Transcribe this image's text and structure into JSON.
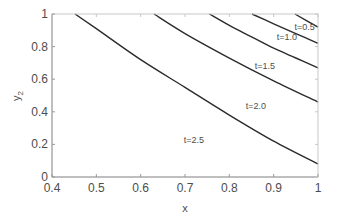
{
  "chart_data": {
    "type": "line",
    "title": "",
    "xlabel": "x",
    "ylabel": "y",
    "ylabel_subscript": "2",
    "xlim": [
      0.4,
      1.0
    ],
    "ylim": [
      0,
      1
    ],
    "grid": false,
    "legend": "inline curve labels",
    "x_ticks": [
      "0.4",
      "0.5",
      "0.6",
      "0.7",
      "0.8",
      "0.9",
      "1"
    ],
    "y_ticks": [
      "0",
      "0.2",
      "0.4",
      "0.6",
      "0.8",
      "1"
    ],
    "series": [
      {
        "name": "t=0.5",
        "x": [
          0.948,
          1.0
        ],
        "y": [
          1.0,
          0.92
        ],
        "label_pos": [
          0.97,
          0.9
        ]
      },
      {
        "name": "t=1.0",
        "x": [
          0.851,
          0.9,
          0.95,
          1.0
        ],
        "y": [
          1.0,
          0.94,
          0.88,
          0.82
        ],
        "label_pos": [
          0.93,
          0.84
        ]
      },
      {
        "name": "t=1.5",
        "x": [
          0.755,
          0.8,
          0.85,
          0.9,
          0.95,
          1.0
        ],
        "y": [
          1.0,
          0.93,
          0.86,
          0.79,
          0.73,
          0.67
        ],
        "label_pos": [
          0.88,
          0.66
        ]
      },
      {
        "name": "t=2.0",
        "x": [
          0.63,
          0.7,
          0.8,
          0.9,
          1.0
        ],
        "y": [
          1.0,
          0.88,
          0.73,
          0.59,
          0.46
        ],
        "label_pos": [
          0.86,
          0.42
        ]
      },
      {
        "name": "t=2.5",
        "x": [
          0.452,
          0.5,
          0.6,
          0.7,
          0.8,
          0.9,
          1.0
        ],
        "y": [
          1.0,
          0.91,
          0.72,
          0.55,
          0.38,
          0.22,
          0.08
        ],
        "label_pos": [
          0.72,
          0.21
        ]
      }
    ]
  }
}
